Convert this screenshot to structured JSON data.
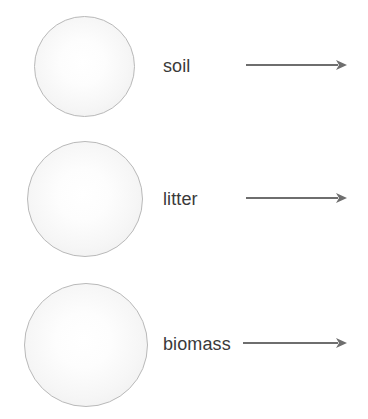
{
  "figure": {
    "type": "carbon-pool-flow-diagram",
    "background_color": "#ffffff",
    "width": 368,
    "height": 419,
    "stroke_color": "#6e6e6e",
    "circle_border_color": "#b9b9b9",
    "circle_fill_color": "#f3f3f3",
    "text_color": "#3a3a3a"
  },
  "rows": [
    {
      "id": "soil",
      "label": "soil",
      "circle": {
        "cx": 84,
        "cy": 66,
        "d": 101
      },
      "label_pos": {
        "x": 163,
        "y": 57
      },
      "arrow": {
        "x1": 246,
        "x2": 347,
        "y": 65
      }
    },
    {
      "id": "litter",
      "label": "litter",
      "circle": {
        "cx": 85,
        "cy": 199,
        "d": 116
      },
      "label_pos": {
        "x": 163,
        "y": 190
      },
      "arrow": {
        "x1": 246,
        "x2": 347,
        "y": 198
      }
    },
    {
      "id": "biomass",
      "label": "biomass",
      "circle": {
        "cx": 86,
        "cy": 345,
        "d": 124
      },
      "label_pos": {
        "x": 163,
        "y": 335
      },
      "arrow": {
        "x1": 243,
        "x2": 347,
        "y": 343
      }
    }
  ]
}
